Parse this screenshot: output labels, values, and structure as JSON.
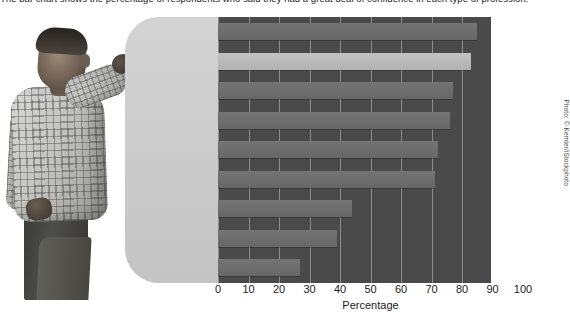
{
  "caption": "The bar chart shows the percentage of respondents who said they had a great deal of confidence in each type of profession.",
  "photo": {
    "alt_name": "man-pointing-at-chart",
    "credit": "Photo: © Kemter/iStockphoto"
  },
  "chart_data": {
    "type": "bar",
    "orientation": "horizontal",
    "title": "",
    "categories": [
      "Doctors",
      "Teachers",
      "Scientists",
      "Police officers",
      "Military officers",
      "Judges",
      "TV newscasters",
      "Journalists",
      "Lawyers"
    ],
    "values": [
      85,
      83,
      77,
      76,
      72,
      71,
      44,
      39,
      27
    ],
    "xlabel": "Percentage",
    "ylabel": "",
    "xlim": [
      0,
      100
    ],
    "xticks": [
      "0",
      "10",
      "20",
      "30",
      "40",
      "50",
      "60",
      "70",
      "80",
      "90",
      "100"
    ],
    "grid": "vertical",
    "legend": "none",
    "highlight_category": "Teachers",
    "colors": {
      "bar": "#6e6e6e",
      "bar_highlight": "#b8b8b8",
      "plot_background": "#4a4a4a",
      "panel_background": "#cdcdcd",
      "gridline": "#9a9a9a",
      "text": "#1d1d1d"
    }
  }
}
